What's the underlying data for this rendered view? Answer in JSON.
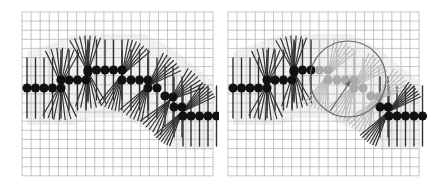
{
  "figure": {
    "panels": [
      {
        "id": "left",
        "label": "intact chain",
        "grid": {
          "x0": 22,
          "y0": 12,
          "cols": 21,
          "rows": 18,
          "cell": 9.1
        },
        "highlight_circle": null
      },
      {
        "id": "right",
        "label": "chain with circled region",
        "grid": {
          "x0": 228,
          "y0": 12,
          "cols": 21,
          "rows": 18,
          "cell": 9.1
        },
        "highlight_circle": {
          "cx": 348,
          "cy": 79,
          "r": 38
        }
      }
    ],
    "colors": {
      "grid": "#b8b8b8",
      "bead": "#111111",
      "spoke": "#333333",
      "faded_bead": "#aaaaaa",
      "faded_spoke": "#bdbdbd",
      "halo": "#e6e6e6",
      "circle": "#666666"
    }
  }
}
